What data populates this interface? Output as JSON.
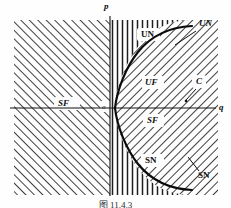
{
  "figure": {
    "caption": "图 11.4.3",
    "type": "bifurcation-diagram",
    "axes": {
      "vertical_label": "p",
      "horizontal_label": "q",
      "origin_label": "o"
    },
    "curve": {
      "name": "parabola",
      "description": "rightward-opening parabola p^2 = 4q through the origin"
    },
    "region_labels": [
      {
        "key": "sf_left",
        "text": "SF",
        "x": 58,
        "y": 100
      },
      {
        "key": "un_inner",
        "text": "UN",
        "x": 141,
        "y": 33
      },
      {
        "key": "uf_inner",
        "text": "UF",
        "x": 146,
        "y": 81
      },
      {
        "key": "sf_inner",
        "text": "SF",
        "x": 147,
        "y": 119
      },
      {
        "key": "sn_inner",
        "text": "SN",
        "x": 145,
        "y": 159
      }
    ],
    "callout_labels": [
      {
        "key": "un_outer",
        "text": "UN",
        "x": 200,
        "y": 22
      },
      {
        "key": "c_point",
        "text": "C",
        "x": 197,
        "y": 80
      },
      {
        "key": "sn_outer",
        "text": "SN",
        "x": 198,
        "y": 173
      }
    ],
    "colors": {
      "ink": "#101010",
      "hatch": "#1d1d1d",
      "background": "#fefefe"
    }
  }
}
